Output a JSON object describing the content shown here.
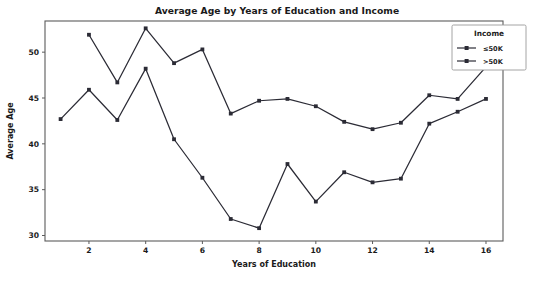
{
  "chart_data": {
    "type": "line",
    "title": "Average Age by Years of Education and Income",
    "xlabel": "Years of Education",
    "ylabel": "Average Age",
    "xlim": [
      0.45,
      16.6
    ],
    "ylim": [
      29.4,
      53.4
    ],
    "xticks": [
      2,
      4,
      6,
      8,
      10,
      12,
      14,
      16
    ],
    "yticks": [
      30,
      35,
      40,
      45,
      50
    ],
    "grid": false,
    "legend": {
      "title": "Income",
      "position": "upper right",
      "entries": [
        "<=50K",
        ">50K"
      ]
    },
    "x": [
      1,
      2,
      3,
      4,
      5,
      6,
      7,
      8,
      9,
      10,
      11,
      12,
      13,
      14,
      15,
      16
    ],
    "series": [
      {
        "name": "<=50K",
        "x": [
          1,
          2,
          3,
          4,
          5,
          6,
          7,
          8,
          9,
          10,
          11,
          12,
          13,
          14,
          15,
          16
        ],
        "values": [
          42.7,
          45.9,
          42.6,
          48.2,
          40.5,
          36.3,
          31.8,
          30.8,
          37.8,
          33.7,
          36.9,
          35.8,
          36.2,
          42.2,
          43.5,
          44.9
        ]
      },
      {
        "name": ">50K",
        "x": [
          2,
          3,
          4,
          5,
          6,
          7,
          8,
          9,
          10,
          11,
          12,
          13,
          14,
          15,
          16
        ],
        "values": [
          51.9,
          46.7,
          52.6,
          48.8,
          50.3,
          43.3,
          44.7,
          44.9,
          44.1,
          42.4,
          41.6,
          42.3,
          45.3,
          44.9,
          48.4
        ]
      }
    ],
    "colors": {
      "series": "#2b2b35",
      "spine": "#5b5b5b",
      "background": "#ffffff",
      "text": "#1a1a1a"
    }
  }
}
